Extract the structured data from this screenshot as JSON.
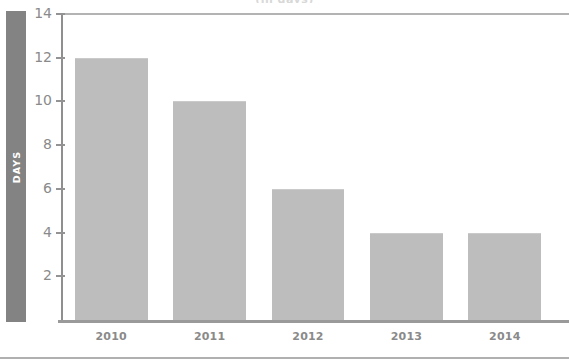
{
  "chart_data": {
    "type": "bar",
    "title": "",
    "xlabel": "",
    "ylabel": "DAYS",
    "categories": [
      "2010",
      "2011",
      "2012",
      "2013",
      "2014"
    ],
    "values": [
      12,
      10,
      6,
      4,
      4
    ],
    "ylim": [
      0,
      14
    ],
    "ytick_labels": [
      "14",
      "12",
      "10",
      "8",
      "6",
      "4",
      "2"
    ],
    "ytick_values": [
      14,
      12,
      10,
      8,
      6,
      4,
      2
    ],
    "grid": false,
    "legend": null,
    "series": [
      {
        "name": "Days",
        "values": [
          12,
          10,
          6,
          4,
          4
        ]
      }
    ],
    "colors": {
      "bar_fill": "#bdbdbd",
      "axis_band": "#838383",
      "axis_line": "#9a9a9a",
      "tick_text": "#8a8a8a",
      "axis_band_text": "#ffffff",
      "background": "#ffffff",
      "rule": "#b0b0b0"
    }
  },
  "axis": {
    "y_title": "DAYS"
  },
  "clipped_title": "(in days)"
}
